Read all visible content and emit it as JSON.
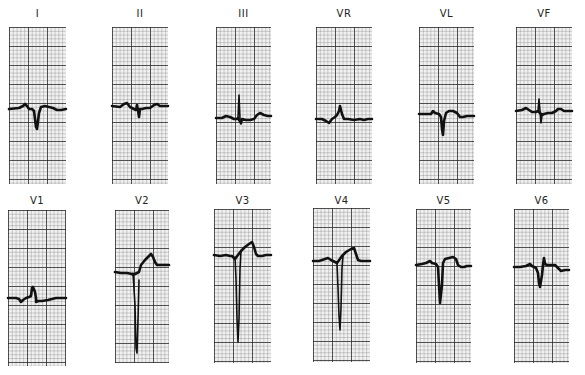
{
  "figure": {
    "type": "12-lead electrocardiogram",
    "rows": [
      {
        "leads": [
          {
            "label": "I",
            "morphology": "small upright P, deep narrow Q/S wave, upright T",
            "box": [
              9,
              27,
              57,
              157
            ]
          },
          {
            "label": "II",
            "morphology": "small P, small r, narrow S, flat T",
            "box": [
              112,
              27,
              56,
              157
            ]
          },
          {
            "label": "III",
            "morphology": "tall narrow R, small s, upright T",
            "box": [
              216,
              27,
              55,
              157
            ]
          },
          {
            "label": "VR",
            "morphology": "small q, upright R, flat ST",
            "box": [
              316,
              27,
              56,
              157
            ]
          },
          {
            "label": "VL",
            "morphology": "small P, deep Q/S, upright T",
            "box": [
              419,
              27,
              55,
              157
            ]
          },
          {
            "label": "VF",
            "morphology": "narrow R then S, upright T",
            "box": [
              516,
              27,
              56,
              157
            ]
          }
        ]
      },
      {
        "leads": [
          {
            "label": "V1",
            "morphology": "small r, rsR', flat T",
            "box": [
              8,
              210,
              58,
              156
            ]
          },
          {
            "label": "V2",
            "morphology": "very deep S wave, ST elevation, peaked T",
            "box": [
              115,
              210,
              54,
              153
            ]
          },
          {
            "label": "V3",
            "morphology": "very deep S wave, ST elevation, peaked T",
            "box": [
              214,
              209,
              57,
              154
            ]
          },
          {
            "label": "V4",
            "morphology": "deep S wave, ST elevation, upright T",
            "box": [
              313,
              208,
              57,
              154
            ]
          },
          {
            "label": "V5",
            "morphology": "deep S wave, mild ST elevation, upright T",
            "box": [
              416,
              209,
              55,
              154
            ]
          },
          {
            "label": "V6",
            "morphology": "moderate S wave, upright T",
            "box": [
              514,
              209,
              55,
              154
            ]
          }
        ]
      }
    ],
    "colors": {
      "paper": "#f1f1f1",
      "grid_major": "#3a3a3a",
      "grid_minor": "#9a9a9a",
      "trace": "#111111",
      "background": "#ffffff"
    }
  }
}
